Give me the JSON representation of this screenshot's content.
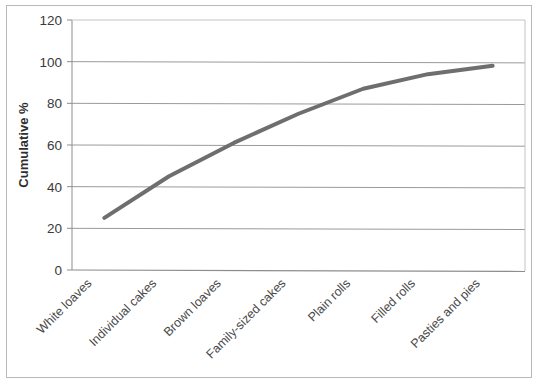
{
  "chart_data": {
    "type": "line",
    "title": "",
    "xlabel": "",
    "ylabel": "Cumulative %",
    "ylim": [
      0,
      120
    ],
    "ytick_step": 20,
    "yticks": [
      "0",
      "20",
      "40",
      "60",
      "80",
      "100",
      "120"
    ],
    "grid": true,
    "legend": "none",
    "categories": [
      "White loaves",
      "Individual cakes",
      "Brown loaves",
      "Family-sized cakes",
      "Plain rolls",
      "Filled rolls",
      "Pasties and pies"
    ],
    "values": [
      25,
      45,
      61,
      75,
      87,
      94,
      98
    ],
    "series": [
      {
        "name": "Cumulative %",
        "values": [
          25,
          45,
          61,
          75,
          87,
          94,
          98
        ]
      }
    ],
    "category_label_rotation": -45,
    "line_color": "#6e6e6e",
    "line_width": 4,
    "gridline_color": "#9a9a9a",
    "axis_color": "#8d8d8d",
    "plot_background": "#ffffff",
    "frame_color": "#b9b9b9"
  }
}
